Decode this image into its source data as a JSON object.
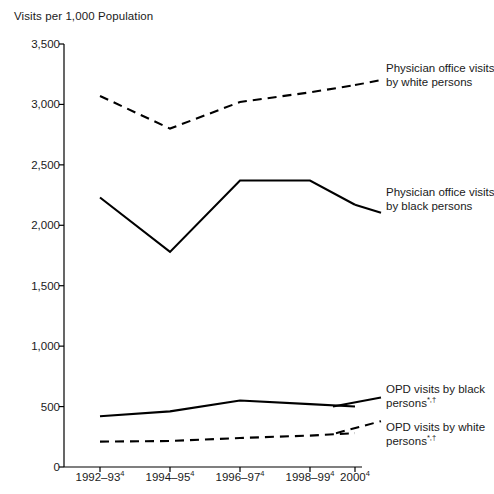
{
  "chart_data": {
    "type": "line",
    "title": "Visits per 1,000 Population",
    "ylabel": "Visits per 1,000 Population",
    "xlabel": "",
    "ylim": [
      0,
      3500
    ],
    "yticks": [
      0,
      500,
      1000,
      1500,
      2000,
      2500,
      3000,
      3500
    ],
    "ytick_labels": [
      "0",
      "500",
      "1,000",
      "1,500",
      "2,000",
      "2,500",
      "3,000",
      "3,500"
    ],
    "categories": [
      "1992–93",
      "1994–95",
      "1996–97",
      "1998–99",
      "2000"
    ],
    "category_footnotes": [
      "4",
      "4",
      "4",
      "4",
      "4"
    ],
    "grid": false,
    "legend_position": "inline-right",
    "series": [
      {
        "name": "Physician office visits by white persons",
        "style": "dashed",
        "values": [
          3070,
          2800,
          3020,
          3100,
          3160
        ]
      },
      {
        "name": "Physician office visits by black persons",
        "style": "solid",
        "values": [
          2230,
          1780,
          2370,
          2370,
          2170
        ]
      },
      {
        "name": "OPD visits by black persons",
        "style": "solid",
        "values": [
          420,
          460,
          550,
          520,
          500
        ]
      },
      {
        "name": "OPD visits by white persons",
        "style": "dashed",
        "values": [
          210,
          215,
          240,
          260,
          280
        ]
      }
    ]
  },
  "annotations": [
    {
      "id": "physician-white",
      "line1": "Physician office visits",
      "line2": "by white persons",
      "footnote": "",
      "style": "dashed"
    },
    {
      "id": "physician-black",
      "line1": "Physician office visits",
      "line2": "by black persons",
      "footnote": "",
      "style": "solid"
    },
    {
      "id": "opd-black",
      "line1": "OPD visits by black",
      "line2": "persons",
      "footnote": "*,†",
      "style": "solid"
    },
    {
      "id": "opd-white",
      "line1": "OPD visits by white",
      "line2": "persons",
      "footnote": "*,†",
      "style": "dashed"
    }
  ],
  "colors": {
    "line": "#000000",
    "axis": "#000000",
    "text": "#1a1a1a",
    "background": "#ffffff"
  }
}
